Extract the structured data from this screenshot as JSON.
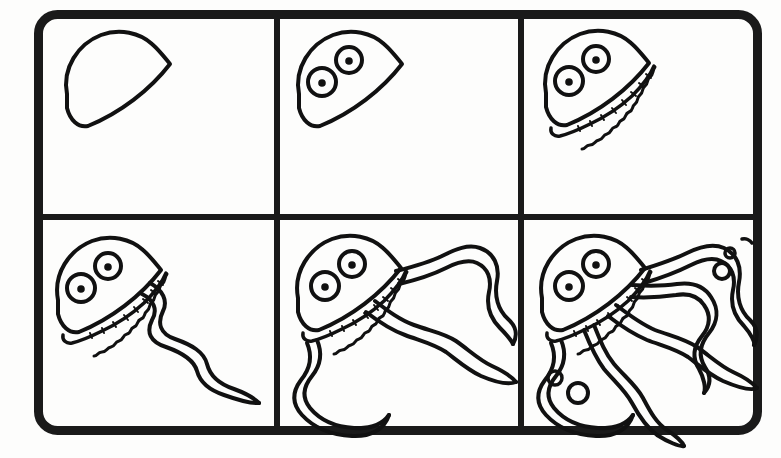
{
  "document": {
    "kind": "step-by-step-drawing-tutorial",
    "subject": "jellyfish",
    "style": "black-ink-line-art-on-white",
    "panel_count": 6,
    "grid": {
      "rows": 2,
      "columns": 3
    }
  },
  "colors": {
    "ink": "#111111",
    "paper": "#fdfdfc",
    "frame": "#1a1a1a"
  },
  "frame": {
    "name": "rounded-outer-border",
    "x": 34,
    "y": 10,
    "width": 728,
    "height": 425,
    "stroke_width": 9,
    "corner_radius": 22
  },
  "dividers": {
    "vertical_x": [
      277,
      521
    ],
    "horizontal_y": [
      217
    ],
    "stroke_width": 6
  },
  "panels": [
    {
      "index": 1,
      "label": "Step 1",
      "caption": "Draw the bell outline",
      "elements": [
        "bell-outline"
      ],
      "bounds": {
        "x": 40,
        "y": 16,
        "w": 237,
        "h": 201
      }
    },
    {
      "index": 2,
      "label": "Step 2",
      "caption": "Add two eyes with pupils",
      "elements": [
        "bell-outline",
        "eye-left",
        "eye-right",
        "pupil-left",
        "pupil-right"
      ],
      "bounds": {
        "x": 277,
        "y": 16,
        "w": 244,
        "h": 201
      }
    },
    {
      "index": 3,
      "label": "Step 3",
      "caption": "Add the frilly bell rim",
      "elements": [
        "bell-outline",
        "eyes",
        "frilly-rim"
      ],
      "bounds": {
        "x": 521,
        "y": 16,
        "w": 235,
        "h": 201
      }
    },
    {
      "index": 4,
      "label": "Step 4",
      "caption": "Add the first long tentacle",
      "elements": [
        "bell-outline",
        "eyes",
        "frilly-rim",
        "tentacle-1"
      ],
      "bounds": {
        "x": 40,
        "y": 217,
        "w": 237,
        "h": 212
      }
    },
    {
      "index": 5,
      "label": "Step 5",
      "caption": "Add two more tentacles",
      "elements": [
        "bell-outline",
        "eyes",
        "frilly-rim",
        "tentacle-1",
        "tentacle-2",
        "tentacle-3"
      ],
      "bounds": {
        "x": 277,
        "y": 217,
        "w": 244,
        "h": 212
      }
    },
    {
      "index": 6,
      "label": "Step 6",
      "caption": "Finish with extra tentacles and bubbles",
      "elements": [
        "bell-outline",
        "eyes",
        "frilly-rim",
        "tentacle-1",
        "tentacle-2",
        "tentacle-3",
        "tentacle-4",
        "tentacle-5",
        "bubbles"
      ],
      "bounds": {
        "x": 521,
        "y": 217,
        "w": 235,
        "h": 212
      }
    }
  ],
  "bubbles": {
    "upper_right": [
      {
        "shape": "dash",
        "cx": 745,
        "cy": 241,
        "r": 4
      },
      {
        "shape": "circle",
        "cx": 730,
        "cy": 253,
        "r": 5
      },
      {
        "shape": "circle",
        "cx": 722,
        "cy": 270,
        "r": 8
      }
    ],
    "lower_left": [
      {
        "shape": "circle",
        "cx": 555,
        "cy": 378,
        "r": 7
      },
      {
        "shape": "circle",
        "cx": 578,
        "cy": 392,
        "r": 10
      }
    ]
  },
  "line_art": {
    "stroke_width_outline": 4,
    "stroke_width_detail": 3
  }
}
